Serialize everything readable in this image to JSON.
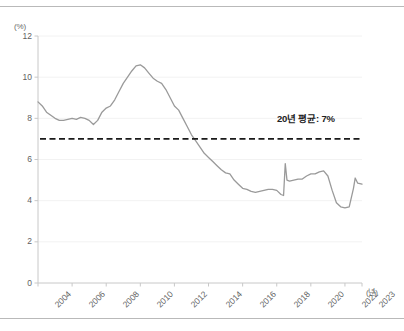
{
  "chart_data": {
    "type": "line",
    "title": "",
    "subtitle": "",
    "xlabel": "(년)",
    "ylabel": "(%)",
    "xlim": [
      2004,
      2023
    ],
    "ylim": [
      0,
      12
    ],
    "grid": true,
    "legend_position": "none",
    "y_ticks": [
      "0",
      "2",
      "4",
      "6",
      "8",
      "10",
      "12"
    ],
    "y_tick_values": [
      0,
      2,
      4,
      6,
      8,
      10,
      12
    ],
    "x_ticks": [
      "2004",
      "2006",
      "2008",
      "2010",
      "2012",
      "2014",
      "2016",
      "2018",
      "2020",
      "2022",
      "2023"
    ],
    "x_tick_values": [
      2004,
      2006,
      2008,
      2010,
      2012,
      2014,
      2016,
      2018,
      2020,
      2022,
      2023
    ],
    "line_color": "#9a9a9a",
    "annotations": [
      {
        "text": "20년 평균: 7%",
        "value": 7,
        "style": "dashed-horizontal-line",
        "color": "#1a1a1a"
      }
    ],
    "series": [
      {
        "name": "비율",
        "color": "#9a9a9a",
        "x": [
          2004.0,
          2004.25,
          2004.5,
          2004.75,
          2005.0,
          2005.25,
          2005.5,
          2005.75,
          2006.0,
          2006.25,
          2006.5,
          2006.75,
          2007.0,
          2007.25,
          2007.5,
          2007.75,
          2008.0,
          2008.25,
          2008.5,
          2008.75,
          2009.0,
          2009.25,
          2009.5,
          2009.75,
          2010.0,
          2010.25,
          2010.5,
          2010.75,
          2011.0,
          2011.25,
          2011.5,
          2011.75,
          2012.0,
          2012.25,
          2012.5,
          2012.75,
          2013.0,
          2013.25,
          2013.5,
          2013.75,
          2014.0,
          2014.25,
          2014.5,
          2014.75,
          2015.0,
          2015.25,
          2015.5,
          2015.75,
          2016.0,
          2016.25,
          2016.5,
          2016.75,
          2017.0,
          2017.25,
          2017.5,
          2017.75,
          2018.0,
          2018.25,
          2018.4,
          2018.5,
          2018.6,
          2018.75,
          2019.0,
          2019.25,
          2019.5,
          2019.75,
          2020.0,
          2020.25,
          2020.5,
          2020.75,
          2021.0,
          2021.25,
          2021.5,
          2021.75,
          2022.0,
          2022.25,
          2022.5,
          2022.6,
          2022.75,
          2023.0
        ],
        "values": [
          8.8,
          8.6,
          8.3,
          8.15,
          8.0,
          7.9,
          7.9,
          7.95,
          8.0,
          7.95,
          8.05,
          8.0,
          7.9,
          7.7,
          7.9,
          8.3,
          8.5,
          8.6,
          8.9,
          9.3,
          9.7,
          10.0,
          10.3,
          10.55,
          10.6,
          10.45,
          10.2,
          9.95,
          9.8,
          9.7,
          9.4,
          9.0,
          8.6,
          8.4,
          8.0,
          7.6,
          7.2,
          6.9,
          6.6,
          6.3,
          6.1,
          5.9,
          5.7,
          5.5,
          5.35,
          5.3,
          5.0,
          4.8,
          4.6,
          4.55,
          4.45,
          4.4,
          4.45,
          4.5,
          4.55,
          4.55,
          4.5,
          4.3,
          4.25,
          5.8,
          5.0,
          4.95,
          5.0,
          5.05,
          5.05,
          5.2,
          5.3,
          5.3,
          5.4,
          5.45,
          5.2,
          4.5,
          3.9,
          3.7,
          3.65,
          3.7,
          4.6,
          5.1,
          4.85,
          4.8
        ]
      }
    ]
  }
}
